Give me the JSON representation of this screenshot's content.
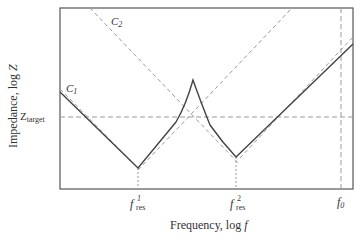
{
  "diagram": {
    "axes": {
      "ylabel": "Impedance, log Z",
      "ylabel_prefix": "Impedance, log ",
      "ylabel_var": "Z",
      "xlabel_prefix": "Frequency, log ",
      "xlabel_var": "f"
    },
    "labels": {
      "c1_main": "C",
      "c1_sub": "1",
      "c2_main": "C",
      "c2_sub": "2",
      "ztarget_main": "Z",
      "ztarget_sub": "target",
      "fres1_main": "f",
      "fres1_sup": "1",
      "fres1_sub": "res",
      "fres2_main": "f",
      "fres2_sup": "2",
      "fres2_sub": "res",
      "f0_main": "f",
      "f0_sub": "0"
    },
    "colors": {
      "frame": "#555555",
      "solid_curve": "#444444",
      "dashed": "#999999"
    }
  }
}
